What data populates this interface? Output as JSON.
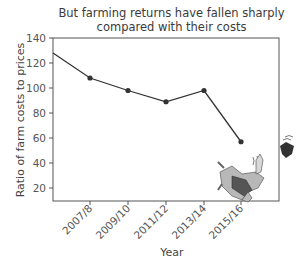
{
  "title_line1": "But farming returns have fallen sharply",
  "title_line2": "compared with their costs",
  "chart_data": {
    "type": "line",
    "title": "But farming returns have fallen sharply compared with their costs",
    "xlabel": "Year",
    "ylabel": "Ratio of farm costs to prices",
    "categories": [
      "2005/6",
      "2007/8",
      "2009/10",
      "2011/12",
      "2013/14",
      "2015/16"
    ],
    "x_tick_labels": [
      "2007/8",
      "2009/10",
      "2011/12",
      "2013/14",
      "2015/16"
    ],
    "series": [
      {
        "name": "Ratio of farm costs to prices",
        "values": [
          128,
          108,
          98,
          89,
          98,
          57
        ],
        "color": "#333333"
      }
    ],
    "y_ticks": [
      20,
      40,
      60,
      80,
      100,
      120,
      140
    ],
    "ylim": [
      9,
      140
    ],
    "grid": false,
    "legend": "none",
    "annotations": [
      "cartoon of falling farmer losing hat"
    ]
  }
}
